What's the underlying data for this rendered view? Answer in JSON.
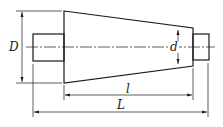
{
  "diagram": {
    "type": "engineering-drawing",
    "labels": {
      "large_diameter": "D",
      "small_diameter": "d",
      "taper_length": "l",
      "total_length": "L"
    },
    "colors": {
      "line": "#1a1a1a",
      "background": "#ffffff"
    }
  }
}
